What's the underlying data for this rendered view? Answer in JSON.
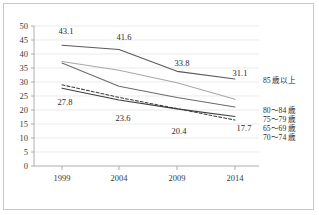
{
  "chart_data": {
    "type": "line",
    "title": "",
    "xlabel": "",
    "ylabel": "",
    "x": [
      "1999",
      "2004",
      "2009",
      "2014"
    ],
    "categories": [
      "1999",
      "2004",
      "2009",
      "2014"
    ],
    "ylim": [
      0,
      50
    ],
    "yticks": [
      "0",
      "5",
      "10",
      "15",
      "20",
      "25",
      "30",
      "35",
      "40",
      "45",
      "50"
    ],
    "grid": true,
    "legend_position": "right",
    "series": [
      {
        "name": "85 歳以上",
        "values": [
          43.1,
          41.6,
          33.8,
          31.1
        ],
        "style": "solid",
        "color": "#5a5a5a",
        "labels": [
          "43.1",
          "41.6",
          "33.8",
          "31.1"
        ]
      },
      {
        "name": "80～84 歳",
        "values": [
          37.3,
          34.2,
          29.7,
          23.8
        ],
        "style": "solid",
        "color": "#a8a8a8",
        "labels": [
          "",
          "",
          "",
          ""
        ]
      },
      {
        "name": "75～79 歳",
        "values": [
          36.8,
          28.5,
          24.5,
          21.1
        ],
        "style": "solid",
        "color": "#6b6b6b",
        "labels": [
          "",
          "",
          "",
          ""
        ]
      },
      {
        "name": "65～69 歳",
        "values": [
          27.8,
          23.6,
          20.4,
          17.7
        ],
        "style": "solid",
        "color": "#3d3d3d",
        "labels": [
          "27.8",
          "23.6",
          "20.4",
          "17.7"
        ]
      },
      {
        "name": "70～74 歳",
        "values": [
          29.0,
          24.5,
          20.5,
          16.4
        ],
        "style": "dashed",
        "color": "#3d3d3d",
        "labels": [
          "",
          "",
          "",
          ""
        ]
      }
    ]
  },
  "axis": {
    "y": {
      "t0": "0",
      "t1": "5",
      "t2": "10",
      "t3": "15",
      "t4": "20",
      "t5": "25",
      "t6": "30",
      "t7": "35",
      "t8": "40",
      "t9": "45",
      "t10": "50"
    },
    "x": {
      "t0": "1999",
      "t1": "2004",
      "t2": "2009",
      "t3": "2014"
    }
  },
  "data_labels": {
    "l_43_1": "43.1",
    "l_41_6": "41.6",
    "l_33_8": "33.8",
    "l_31_1": "31.1",
    "l_27_8": "27.8",
    "l_23_6": "23.6",
    "l_20_4": "20.4",
    "l_17_7": "17.7"
  },
  "legend": {
    "item0": "85 歳以上",
    "item1": "80～84 歳",
    "item2": "75～79 歳",
    "item3": "65～69 歳",
    "item4": "70～74 歳"
  },
  "colors": {
    "frame": "#c9c9c9",
    "grid": "#d9d9d9",
    "axis": "#9a9a9a",
    "text": "#2b2b2b"
  }
}
